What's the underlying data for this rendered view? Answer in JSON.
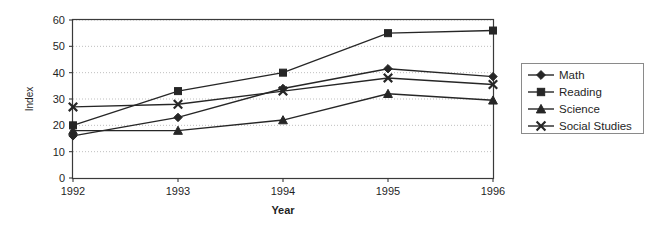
{
  "chart_data": {
    "type": "line",
    "title": "",
    "xlabel": "Year",
    "ylabel": "Index",
    "categories": [
      "1992",
      "1993",
      "1994",
      "1995",
      "1996"
    ],
    "ylim": [
      0,
      60
    ],
    "yticks": [
      "0",
      "10",
      "20",
      "30",
      "40",
      "50",
      "60"
    ],
    "grid": true,
    "legend_position": "right",
    "series": [
      {
        "name": "Math",
        "marker": "diamond",
        "values": [
          16,
          23,
          34,
          41.5,
          38.5
        ]
      },
      {
        "name": "Reading",
        "marker": "square",
        "values": [
          20,
          33,
          40,
          55,
          56
        ]
      },
      {
        "name": "Science",
        "marker": "triangle",
        "values": [
          18,
          18,
          22,
          32,
          29.5
        ]
      },
      {
        "name": "Social Studies",
        "marker": "x",
        "values": [
          27,
          28,
          33,
          38,
          35.5
        ]
      }
    ]
  },
  "legend": {
    "items": [
      {
        "label": "Math"
      },
      {
        "label": "Reading"
      },
      {
        "label": "Science"
      },
      {
        "label": "Social Studies"
      }
    ]
  },
  "colors": {
    "series": "#262626",
    "grid": "#bfbfbf",
    "axis": "#3a3a3a",
    "background": "#ffffff"
  }
}
